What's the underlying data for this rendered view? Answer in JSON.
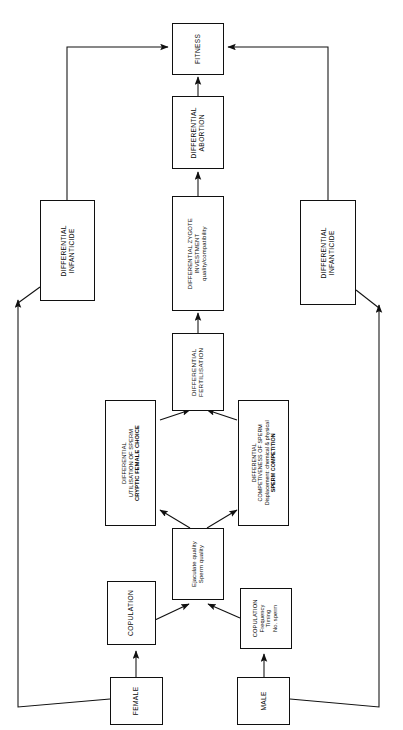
{
  "figure": {
    "kind": "flowchart",
    "orientation": "rotated-90-ccw",
    "caption_fragment": "",
    "colors": {
      "stroke": "#101010",
      "fill": "#ffffff",
      "text": "#0a0a0a"
    }
  },
  "nodes": {
    "fitness": {
      "lines": [
        "FITNESS"
      ]
    },
    "differential_abortion": {
      "lines": [
        "DIFFERENTIAL",
        "ABORTION"
      ]
    },
    "differential_zygote": {
      "lines": [
        "DIFFERENTIAL ZYGOTE",
        "INVESTMENT",
        "quality/compatibility"
      ]
    },
    "differential_fertilisation": {
      "lines": [
        "DIFFERENTIAL",
        "FERTILISATION"
      ]
    },
    "female_choice": {
      "lines": [
        "DIFFERENTIAL",
        "UTILISATION OF SPERM",
        "CRYPTIC FEMALE CHOICE"
      ]
    },
    "sperm_competition": {
      "lines": [
        "DIFFERENTIAL",
        "COMPETIVENESS OF SPERM",
        "Displacement: chemical & physical",
        "SPERM COMPETITION"
      ]
    },
    "ejaculate_quality": {
      "lines": [
        "Ejaculate quality",
        "Sperm quality"
      ]
    },
    "copulation_female": {
      "lines": [
        "COPULATION"
      ]
    },
    "copulation_male": {
      "lines": [
        "COPULATION",
        "Frequency",
        "Timing",
        "No. sperm"
      ]
    },
    "infanticide_left": {
      "lines": [
        "DIFFERENTIAL",
        "INFANTICIDE"
      ]
    },
    "infanticide_right": {
      "lines": [
        "DIFFERENTIAL",
        "INFANTICIDE"
      ]
    },
    "female": {
      "lines": [
        "FEMALE"
      ]
    },
    "male": {
      "lines": [
        "MALE"
      ]
    }
  },
  "edges": [
    {
      "from": "female",
      "to": "copulation_female"
    },
    {
      "from": "male",
      "to": "copulation_male"
    },
    {
      "from": "copulation_female",
      "to": "ejaculate_quality"
    },
    {
      "from": "copulation_male",
      "to": "ejaculate_quality"
    },
    {
      "from": "ejaculate_quality",
      "to": "female_choice"
    },
    {
      "from": "ejaculate_quality",
      "to": "sperm_competition"
    },
    {
      "from": "female_choice",
      "to": "differential_fertilisation"
    },
    {
      "from": "sperm_competition",
      "to": "differential_fertilisation"
    },
    {
      "from": "differential_fertilisation",
      "to": "differential_zygote"
    },
    {
      "from": "differential_zygote",
      "to": "differential_abortion"
    },
    {
      "from": "differential_abortion",
      "to": "fitness"
    },
    {
      "from": "female",
      "to": "infanticide_left"
    },
    {
      "from": "infanticide_left",
      "to": "fitness"
    },
    {
      "from": "male",
      "to": "infanticide_right"
    },
    {
      "from": "infanticide_right",
      "to": "fitness"
    }
  ]
}
